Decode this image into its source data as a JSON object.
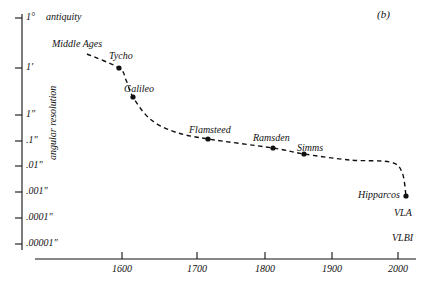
{
  "figure": {
    "panel_label": "(b)",
    "background_color": "#ffffff",
    "ink_color": "#111111"
  },
  "chart_data": {
    "type": "line",
    "title": "",
    "subtitle": "",
    "xlabel": "",
    "ylabel": "angular resolution",
    "xlim": [
      1500,
      2040
    ],
    "ylim_log_arcsec": [
      3600,
      1e-05
    ],
    "grid": false,
    "legend": null,
    "x_ticks": [
      {
        "label": "1600",
        "value": 1600,
        "px": 122
      },
      {
        "label": "1700",
        "value": 1700,
        "px": 197
      },
      {
        "label": "1800",
        "value": 1800,
        "px": 265
      },
      {
        "label": "1900",
        "value": 1900,
        "px": 332
      },
      {
        "label": "2000",
        "value": 2000,
        "px": 398
      }
    ],
    "y_ticks": [
      {
        "label": "1°",
        "arcsec": 3600,
        "px": 18
      },
      {
        "label": "1'",
        "arcsec": 60,
        "px": 68
      },
      {
        "label": "1\"",
        "arcsec": 1,
        "px": 115
      },
      {
        "label": ".1\"",
        "arcsec": 0.1,
        "px": 141
      },
      {
        "label": ".01\"",
        "arcsec": 0.01,
        "px": 166
      },
      {
        "label": ".001\"",
        "arcsec": 0.001,
        "px": 192
      },
      {
        "label": ".0001\"",
        "arcsec": 0.0001,
        "px": 218
      },
      {
        "label": ".00001\"",
        "arcsec": 1e-05,
        "px": 244
      }
    ],
    "series": [
      {
        "name": "angular resolution of astronomical instruments",
        "style": "dashed",
        "points": [
          {
            "label": "",
            "x_px": 87,
            "y_px": 54,
            "marker": false
          },
          {
            "label": "Tycho",
            "x_px": 119,
            "y_px": 68,
            "marker": true,
            "year": 1595,
            "resolution": "1'"
          },
          {
            "label": "",
            "x_px": 126,
            "y_px": 80,
            "marker": false
          },
          {
            "label": "Galileo",
            "x_px": 133,
            "y_px": 97,
            "marker": true,
            "year": 1610,
            "resolution": "~20\""
          },
          {
            "label": "",
            "x_px": 150,
            "y_px": 119,
            "marker": false
          },
          {
            "label": "",
            "x_px": 175,
            "y_px": 132,
            "marker": false
          },
          {
            "label": "Flamsteed",
            "x_px": 208,
            "y_px": 139,
            "marker": true,
            "year": 1690,
            "resolution": "~.1\""
          },
          {
            "label": "Ramsden",
            "x_px": 273,
            "y_px": 148,
            "marker": true,
            "year": 1790,
            "resolution": "~.05\""
          },
          {
            "label": "Simms",
            "x_px": 304,
            "y_px": 154,
            "marker": true,
            "year": 1840,
            "resolution": "~.03\""
          },
          {
            "label": "",
            "x_px": 350,
            "y_px": 160,
            "marker": false
          },
          {
            "label": "",
            "x_px": 390,
            "y_px": 162,
            "marker": false
          },
          {
            "label": "",
            "x_px": 402,
            "y_px": 172,
            "marker": false
          },
          {
            "label": "Hipparcos",
            "x_px": 406,
            "y_px": 196,
            "marker": true,
            "year": 1990,
            "resolution": ".001\""
          }
        ]
      }
    ],
    "era_annotations": [
      {
        "text": "antiquity",
        "x_px": 46,
        "y_px": 12
      },
      {
        "text": "Middle Ages",
        "x_px": 52,
        "y_px": 39
      }
    ],
    "point_annotations": [
      {
        "text": "Tycho",
        "x_px": 109,
        "y_px": 51
      },
      {
        "text": "Galileo",
        "x_px": 124,
        "y_px": 84
      },
      {
        "text": "Flamsteed",
        "x_px": 189,
        "y_px": 125
      },
      {
        "text": "Ramsden",
        "x_px": 253,
        "y_px": 133
      },
      {
        "text": "Simms",
        "x_px": 297,
        "y_px": 143
      },
      {
        "text": "Hipparcos",
        "x_px": 358,
        "y_px": 190
      }
    ],
    "technique_annotations": [
      {
        "text": "VLA",
        "x_px": 394,
        "y_px": 208
      },
      {
        "text": "VLBI",
        "x_px": 392,
        "y_px": 233
      }
    ]
  }
}
